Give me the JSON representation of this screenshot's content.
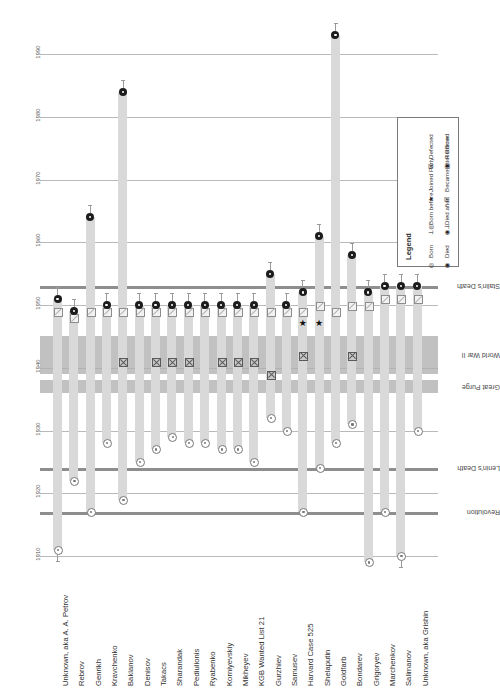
{
  "chart_data": {
    "type": "timeline",
    "title": "",
    "orientation": "rotated-180",
    "ylabel": "",
    "xlabel": "",
    "ylim": [
      1908,
      1996
    ],
    "yticks": [
      1910,
      1920,
      1930,
      1940,
      1950,
      1960,
      1970,
      1980,
      1990
    ],
    "ytick_labels": [
      "1910",
      "1920",
      "1930",
      "1940",
      "1950",
      "1960",
      "1970",
      "1980",
      "1990"
    ],
    "grid": true,
    "categories": [
      "Unknown, aka A. A. Petrov",
      "Rebrov",
      "Genrikh",
      "Kravchenko",
      "Baklanov",
      "Denisov",
      "Takacs",
      "Sharandak",
      "Pediulionis",
      "Ryabenko",
      "Korniyevskiy",
      "Mikheyev",
      "KGB Wanted List 21",
      "Gurzhiev",
      "Samusev",
      "Harvard Case 525",
      "Shelaputin",
      "Goldfarb",
      "Bondarev",
      "Grigoryev",
      "Marchenkov",
      "Salimanov",
      "Unknown, aka Grishin"
    ],
    "events": [
      {
        "name": "Revolution",
        "year": 1917,
        "kind": "line",
        "span": null
      },
      {
        "name": "Lenin's Death",
        "year": 1924,
        "kind": "line",
        "span": null
      },
      {
        "name": "Great Purge",
        "year": 1937,
        "kind": "band",
        "span": [
          1936,
          1938
        ]
      },
      {
        "name": "World War II",
        "year": 1942,
        "kind": "band",
        "span": [
          1939,
          1945
        ]
      },
      {
        "name": "Stalin's Death",
        "year": 1953,
        "kind": "line",
        "span": null
      }
    ],
    "series": [
      {
        "name": "Unknown, aka A. A. Petrov",
        "born": 1911,
        "born_before": true,
        "joined_party": null,
        "intel": null,
        "defected": null,
        "returned": 1949,
        "died": 1951,
        "died_after": true
      },
      {
        "name": "Rebrov",
        "born": 1922,
        "born_before": false,
        "joined_party": null,
        "intel": null,
        "defected": null,
        "returned": 1948,
        "died": 1949,
        "died_after": true
      },
      {
        "name": "Genrikh",
        "born": 1917,
        "born_before": false,
        "joined_party": null,
        "intel": null,
        "defected": null,
        "returned": 1949,
        "died": 1964,
        "died_after": true
      },
      {
        "name": "Kravchenko",
        "born": 1928,
        "born_before": false,
        "joined_party": null,
        "intel": null,
        "defected": null,
        "returned": 1949,
        "died": 1950,
        "died_after": true
      },
      {
        "name": "Baklanov",
        "born": 1919,
        "born_before": false,
        "joined_party": null,
        "intel": 1941,
        "defected": null,
        "returned": 1949,
        "died": 1984,
        "died_after": true
      },
      {
        "name": "Denisov",
        "born": 1925,
        "born_before": false,
        "joined_party": null,
        "intel": null,
        "defected": null,
        "returned": 1949,
        "died": 1950,
        "died_after": true
      },
      {
        "name": "Takacs",
        "born": 1927,
        "born_before": false,
        "joined_party": null,
        "intel": 1941,
        "defected": null,
        "returned": 1949,
        "died": 1950,
        "died_after": true
      },
      {
        "name": "Sharandak",
        "born": 1929,
        "born_before": false,
        "joined_party": null,
        "intel": 1941,
        "defected": null,
        "returned": 1949,
        "died": 1950,
        "died_after": true
      },
      {
        "name": "Pediulionis",
        "born": 1928,
        "born_before": false,
        "joined_party": null,
        "intel": 1941,
        "defected": null,
        "returned": 1949,
        "died": 1950,
        "died_after": true
      },
      {
        "name": "Ryabenko",
        "born": 1928,
        "born_before": false,
        "joined_party": null,
        "intel": null,
        "defected": null,
        "returned": 1949,
        "died": 1950,
        "died_after": true
      },
      {
        "name": "Korniyevskiy",
        "born": 1927,
        "born_before": false,
        "joined_party": null,
        "intel": 1941,
        "defected": null,
        "returned": 1949,
        "died": 1950,
        "died_after": true
      },
      {
        "name": "Mikheyev",
        "born": 1927,
        "born_before": false,
        "joined_party": null,
        "intel": 1941,
        "defected": null,
        "returned": 1949,
        "died": 1950,
        "died_after": true
      },
      {
        "name": "KGB Wanted List 21",
        "born": 1925,
        "born_before": false,
        "joined_party": null,
        "intel": 1941,
        "defected": null,
        "returned": 1949,
        "died": 1950,
        "died_after": true
      },
      {
        "name": "Gurzhiev",
        "born": 1932,
        "born_before": false,
        "joined_party": null,
        "intel": 1939,
        "defected": null,
        "returned": 1949,
        "died": 1955,
        "died_after": true
      },
      {
        "name": "Samusev",
        "born": 1930,
        "born_before": false,
        "joined_party": null,
        "intel": null,
        "defected": null,
        "returned": 1949,
        "died": 1950,
        "died_after": true
      },
      {
        "name": "Harvard Case 525",
        "born": 1917,
        "born_before": false,
        "joined_party": 1947,
        "intel": 1942,
        "defected": null,
        "returned": 1949,
        "died": 1952,
        "died_after": true
      },
      {
        "name": "Shelaputin",
        "born": 1924,
        "born_before": false,
        "joined_party": 1947,
        "intel": null,
        "defected": null,
        "returned": 1950,
        "died": 1961,
        "died_after": true
      },
      {
        "name": "Goldfarb",
        "born": 1928,
        "born_before": false,
        "joined_party": null,
        "intel": null,
        "defected": null,
        "returned": 1949,
        "died": 1993,
        "died_after": true
      },
      {
        "name": "Bondarev",
        "born": 1931,
        "born_before": false,
        "joined_party": null,
        "intel": 1942,
        "defected": null,
        "returned": 1950,
        "died": 1958,
        "died_after": true
      },
      {
        "name": "Grigoryev",
        "born": 1909,
        "born_before": false,
        "joined_party": null,
        "intel": null,
        "defected": null,
        "returned": 1950,
        "died": 1952,
        "died_after": true
      },
      {
        "name": "Marchenkov",
        "born": 1917,
        "born_before": false,
        "joined_party": null,
        "intel": null,
        "defected": null,
        "returned": 1951,
        "died": 1953,
        "died_after": true
      },
      {
        "name": "Salimanov",
        "born": 1910,
        "born_before": true,
        "joined_party": null,
        "intel": null,
        "defected": null,
        "returned": 1951,
        "died": 1953,
        "died_after": true
      },
      {
        "name": "Unknown, aka Grishin",
        "born": 1930,
        "born_before": false,
        "joined_party": null,
        "intel": null,
        "defected": null,
        "returned": 1951,
        "died": 1953,
        "died_after": true
      }
    ]
  },
  "legend": {
    "title": "Legend",
    "items": [
      {
        "glyph": "born-icon",
        "label": "Born"
      },
      {
        "glyph": "born-before-icon",
        "label": "Born before"
      },
      {
        "glyph": "joined-party-icon",
        "label": "Joined Party"
      },
      {
        "glyph": "defected-icon",
        "label": "Defected"
      },
      {
        "glyph": "died-icon",
        "label": "Died"
      },
      {
        "glyph": "died-after-icon",
        "label": "Died after"
      },
      {
        "glyph": "intel-officer-icon",
        "label": "Became Intel Officer"
      },
      {
        "glyph": "returned-icon",
        "label": "Returned"
      }
    ]
  }
}
